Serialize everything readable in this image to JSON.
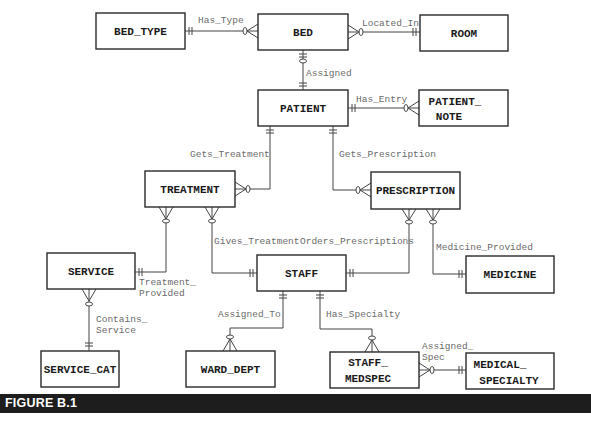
{
  "figure": {
    "caption": "FIGURE B.1",
    "bar_color": "#1d1d1d"
  },
  "entities": {
    "bed_type": {
      "lines": [
        "BED_TYPE"
      ]
    },
    "bed": {
      "lines": [
        "BED"
      ]
    },
    "room": {
      "lines": [
        "ROOM"
      ]
    },
    "patient": {
      "lines": [
        "PATIENT"
      ]
    },
    "patient_note": {
      "lines": [
        "PATIENT_",
        "NOTE"
      ]
    },
    "treatment": {
      "lines": [
        "TREATMENT"
      ]
    },
    "prescription": {
      "lines": [
        "PRESCRIPTION"
      ]
    },
    "service": {
      "lines": [
        "SERVICE"
      ]
    },
    "staff": {
      "lines": [
        "STAFF"
      ]
    },
    "medicine": {
      "lines": [
        "MEDICINE"
      ]
    },
    "service_cat": {
      "lines": [
        "SERVICE_CAT"
      ]
    },
    "ward_dept": {
      "lines": [
        "WARD_DEPT"
      ]
    },
    "staff_medspec": {
      "lines": [
        "STAFF_",
        "MEDSPEC"
      ]
    },
    "medical_specialty": {
      "lines": [
        "MEDICAL_",
        "SPECIALTY"
      ]
    }
  },
  "relationships": {
    "has_type": {
      "lines": [
        "Has_Type"
      ],
      "from": "BED_TYPE",
      "to": "BED"
    },
    "located_in": {
      "lines": [
        "Located_In"
      ],
      "from": "ROOM",
      "to": "BED"
    },
    "assigned": {
      "lines": [
        "Assigned"
      ],
      "from": "BED",
      "to": "PATIENT"
    },
    "has_entry": {
      "lines": [
        "Has_Entry"
      ],
      "from": "PATIENT",
      "to": "PATIENT_NOTE"
    },
    "gets_treatment": {
      "lines": [
        "Gets_Treatment"
      ],
      "from": "PATIENT",
      "to": "TREATMENT"
    },
    "gets_prescription": {
      "lines": [
        "Gets_Prescription"
      ],
      "from": "PATIENT",
      "to": "PRESCRIPTION"
    },
    "gives_treatment": {
      "lines": [
        "Gives_Treatment"
      ],
      "from": "STAFF",
      "to": "TREATMENT"
    },
    "orders_prescriptions": {
      "lines": [
        "Orders_Prescriptions"
      ],
      "from": "STAFF",
      "to": "PRESCRIPTION"
    },
    "medicine_provided": {
      "lines": [
        "Medicine_Provided"
      ],
      "from": "MEDICINE",
      "to": "PRESCRIPTION"
    },
    "treatment_provided": {
      "lines": [
        "Treatment_",
        "Provided"
      ],
      "from": "SERVICE",
      "to": "TREATMENT"
    },
    "contains_service": {
      "lines": [
        "Contains_",
        "Service"
      ],
      "from": "SERVICE_CAT",
      "to": "SERVICE"
    },
    "assigned_to": {
      "lines": [
        "Assigned_To"
      ],
      "from": "STAFF",
      "to": "WARD_DEPT"
    },
    "has_specialty": {
      "lines": [
        "Has_Specialty"
      ],
      "from": "STAFF",
      "to": "STAFF_MEDSPEC"
    },
    "assigned_spec": {
      "lines": [
        "Assigned_",
        "Spec"
      ],
      "from": "MEDICAL_SPECIALTY",
      "to": "STAFF_MEDSPEC"
    }
  }
}
